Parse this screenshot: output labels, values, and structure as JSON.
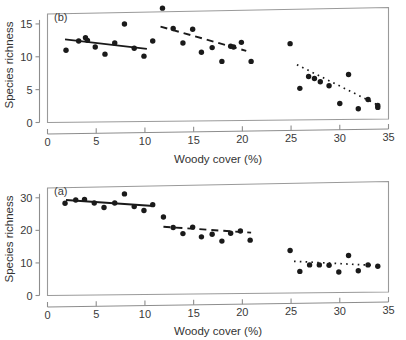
{
  "figure": {
    "width": 406,
    "height": 340,
    "background": "#ffffff",
    "ink_color": "#1a1a1a",
    "axis_color": "#8d8d8d"
  },
  "panels": [
    {
      "id": "panel-b",
      "label": "(b)",
      "position": "top"
    },
    {
      "id": "panel-a",
      "label": "(a)",
      "position": "bottom"
    }
  ],
  "chart_data": [
    {
      "type": "scatter",
      "id": "panel-b",
      "panel_label": "(b)",
      "title": "",
      "xlabel": "Woody cover (%)",
      "ylabel": "Species richness",
      "xlim": [
        0,
        35
      ],
      "ylim": [
        0,
        17.5
      ],
      "xticks": [
        0,
        5,
        10,
        15,
        20,
        25,
        30,
        35
      ],
      "xticklabels": [
        "0",
        "5",
        "10",
        "15",
        "20",
        "25",
        "30",
        "35"
      ],
      "yticks": [
        0,
        5,
        10,
        15
      ],
      "yticklabels": [
        "0",
        "5",
        "10",
        "15"
      ],
      "grid": false,
      "legend": "none",
      "points": [
        {
          "x": 1.9,
          "y": 11.0
        },
        {
          "x": 3.2,
          "y": 12.4
        },
        {
          "x": 3.9,
          "y": 12.9
        },
        {
          "x": 4.1,
          "y": 12.5
        },
        {
          "x": 4.9,
          "y": 11.5
        },
        {
          "x": 5.9,
          "y": 10.4
        },
        {
          "x": 6.9,
          "y": 12.1
        },
        {
          "x": 7.9,
          "y": 15.0
        },
        {
          "x": 8.9,
          "y": 11.3
        },
        {
          "x": 9.9,
          "y": 10.1
        },
        {
          "x": 10.8,
          "y": 12.4
        },
        {
          "x": 11.8,
          "y": 17.4
        },
        {
          "x": 12.9,
          "y": 14.3
        },
        {
          "x": 13.9,
          "y": 12.1
        },
        {
          "x": 14.9,
          "y": 14.2
        },
        {
          "x": 15.8,
          "y": 10.7
        },
        {
          "x": 16.9,
          "y": 11.4
        },
        {
          "x": 17.9,
          "y": 9.3
        },
        {
          "x": 18.8,
          "y": 11.6
        },
        {
          "x": 19.1,
          "y": 11.5
        },
        {
          "x": 19.9,
          "y": 12.2
        },
        {
          "x": 20.9,
          "y": 9.3
        },
        {
          "x": 24.9,
          "y": 12.0
        },
        {
          "x": 25.9,
          "y": 5.2
        },
        {
          "x": 26.8,
          "y": 7.0
        },
        {
          "x": 27.4,
          "y": 6.7
        },
        {
          "x": 28.0,
          "y": 6.2
        },
        {
          "x": 28.9,
          "y": 5.6
        },
        {
          "x": 30.0,
          "y": 2.9
        },
        {
          "x": 30.9,
          "y": 7.3
        },
        {
          "x": 31.9,
          "y": 2.1
        },
        {
          "x": 32.9,
          "y": 3.5
        },
        {
          "x": 33.9,
          "y": 2.6
        },
        {
          "x": 33.9,
          "y": 2.3
        }
      ],
      "trends": [
        {
          "name": "low-cover",
          "style": "solid",
          "x0": 1.8,
          "y0": 12.65,
          "x1": 10.2,
          "y1": 11.2
        },
        {
          "name": "mid-cover",
          "style": "dashed",
          "x0": 11.6,
          "y0": 14.6,
          "x1": 20.4,
          "y1": 10.9
        },
        {
          "name": "high-cover",
          "style": "dotted",
          "x0": 25.6,
          "y0": 8.8,
          "x1": 34.0,
          "y1": 2.6
        }
      ]
    },
    {
      "type": "scatter",
      "id": "panel-a",
      "panel_label": "(a)",
      "title": "",
      "xlabel": "Woody cover (%)",
      "ylabel": "Species richness",
      "xlim": [
        0,
        35
      ],
      "ylim": [
        0,
        35
      ],
      "xticks": [
        0,
        5,
        10,
        15,
        20,
        25,
        30,
        35
      ],
      "xticklabels": [
        "0",
        "5",
        "10",
        "15",
        "20",
        "25",
        "30",
        "35"
      ],
      "yticks": [
        0,
        10,
        20,
        30
      ],
      "yticklabels": [
        "0",
        "10",
        "20",
        "30"
      ],
      "grid": false,
      "legend": "none",
      "points": [
        {
          "x": 1.8,
          "y": 28.3
        },
        {
          "x": 2.9,
          "y": 29.3
        },
        {
          "x": 3.8,
          "y": 29.5
        },
        {
          "x": 4.8,
          "y": 28.4
        },
        {
          "x": 5.8,
          "y": 27.0
        },
        {
          "x": 6.9,
          "y": 28.4
        },
        {
          "x": 7.9,
          "y": 31.2
        },
        {
          "x": 8.9,
          "y": 27.3
        },
        {
          "x": 9.9,
          "y": 26.1
        },
        {
          "x": 10.8,
          "y": 27.9
        },
        {
          "x": 11.9,
          "y": 24.1
        },
        {
          "x": 12.9,
          "y": 20.9
        },
        {
          "x": 13.9,
          "y": 19.0
        },
        {
          "x": 14.9,
          "y": 21.0
        },
        {
          "x": 15.8,
          "y": 18.0
        },
        {
          "x": 16.9,
          "y": 18.8
        },
        {
          "x": 17.9,
          "y": 16.7
        },
        {
          "x": 18.8,
          "y": 19.1
        },
        {
          "x": 19.8,
          "y": 19.8
        },
        {
          "x": 20.8,
          "y": 17.0
        },
        {
          "x": 24.9,
          "y": 13.8
        },
        {
          "x": 25.9,
          "y": 7.4
        },
        {
          "x": 26.9,
          "y": 9.4
        },
        {
          "x": 27.9,
          "y": 9.4
        },
        {
          "x": 28.9,
          "y": 9.3
        },
        {
          "x": 29.9,
          "y": 7.2
        },
        {
          "x": 30.9,
          "y": 12.3
        },
        {
          "x": 31.9,
          "y": 7.6
        },
        {
          "x": 32.9,
          "y": 9.4
        },
        {
          "x": 33.9,
          "y": 9.0
        }
      ],
      "trends": [
        {
          "name": "low-cover",
          "style": "solid",
          "x0": 1.9,
          "y0": 29.3,
          "x1": 10.9,
          "y1": 27.5
        },
        {
          "name": "mid-cover",
          "style": "dashed",
          "x0": 11.9,
          "y0": 21.1,
          "x1": 20.9,
          "y1": 19.3
        },
        {
          "name": "high-cover",
          "style": "dotted",
          "x0": 25.3,
          "y0": 10.5,
          "x1": 33.2,
          "y1": 9.3
        }
      ]
    }
  ]
}
